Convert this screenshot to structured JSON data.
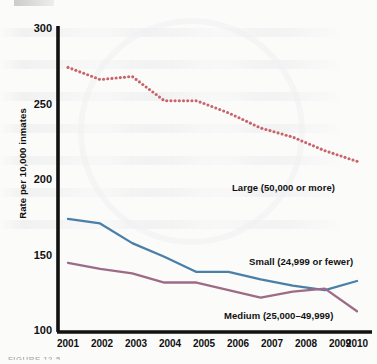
{
  "figure": {
    "caption": "FIGURE 12-5",
    "top_cut_text": ""
  },
  "chart_data": {
    "type": "line",
    "title": "",
    "xlabel": "",
    "ylabel": "Rate per 10,000 inmates",
    "x": [
      2001,
      2002,
      2003,
      2004,
      2005,
      2006,
      2007,
      2008,
      2009,
      2010
    ],
    "xticklabels": [
      "2001",
      "2002",
      "2003",
      "2004",
      "2005",
      "2006",
      "2007",
      "2008",
      "2009",
      "2010"
    ],
    "yticklabels": [
      "300",
      "250",
      "200",
      "150",
      "100"
    ],
    "yticks": [
      300,
      250,
      200,
      150,
      100
    ],
    "ylim": [
      100,
      300
    ],
    "xlim": [
      2001,
      2010
    ],
    "grid": false,
    "legend": "inline-annotations",
    "series": [
      {
        "name": "Large (50,000 or more)",
        "label": "Large (50,000 or more)",
        "color": "#c9636b",
        "style": "dotted",
        "values": [
          274,
          266,
          268,
          252,
          252,
          244,
          234,
          228,
          219,
          212
        ],
        "label_x": 232,
        "label_y": 188
      },
      {
        "name": "Small (24,999 or fewer)",
        "label": "Small (24,999 or fewer)",
        "color": "#4a7fa8",
        "style": "solid",
        "values": [
          174,
          171,
          158,
          149,
          139,
          139,
          134,
          130,
          127,
          133
        ],
        "label_x": 251,
        "label_y": 260
      },
      {
        "name": "Medium (25,000–49,999)",
        "label": "Medium (25,000–49,999)",
        "color": "#9d6b86",
        "style": "solid",
        "values": [
          145,
          141,
          138,
          132,
          132,
          127,
          122,
          126,
          128,
          113
        ],
        "label_x": 225,
        "label_y": 315
      }
    ],
    "axis_color": "#111111",
    "background": "#fbfbfa"
  }
}
